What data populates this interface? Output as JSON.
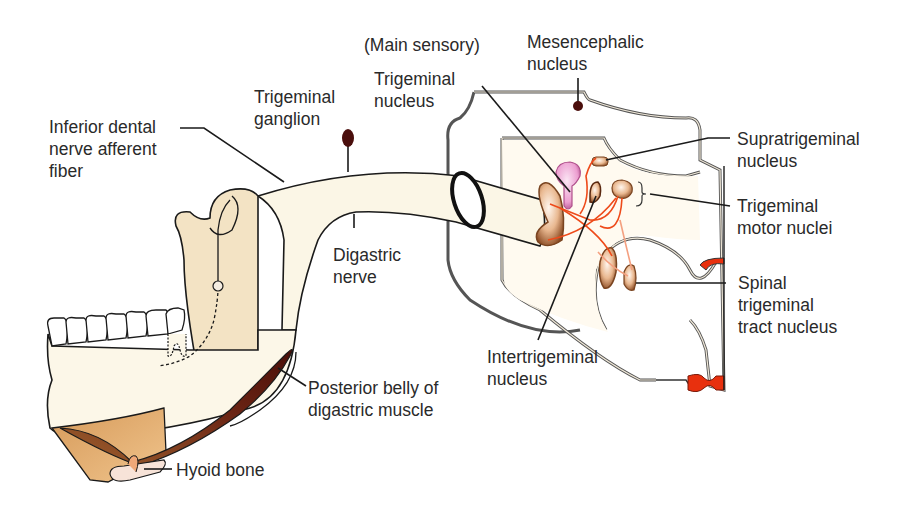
{
  "diagram": {
    "colors": {
      "nerve_fill": "#fbf6e6",
      "bone_fill": "#f3e3c4",
      "jaw_fill": "#fcf7e8",
      "muscle_dark": "#5a1a10",
      "hyoid_fill": "#f7e3d8",
      "nucleus_fill": "#e8b68c",
      "nucleus_edge": "#7a4420",
      "main_sensory_fill": "#ec9ed0",
      "fiber_red": "#ee4a1a",
      "red_marker": "#e8300e",
      "outline": "#1a1a1a",
      "ganglion": "#4a0e0c"
    },
    "labels": {
      "main_sensory_paren": "(Main sensory)",
      "trigeminal_nucleus": "Trigeminal\nnucleus",
      "mesencephalic_nucleus": "Mesencephalic\nnucleus",
      "trigeminal_ganglion": "Trigeminal\nganglion",
      "inferior_dental": "Inferior dental\nnerve afferent\nfiber",
      "supratrigeminal": "Supratrigeminal\nnucleus",
      "trigeminal_motor": "Trigeminal\nmotor nuclei",
      "digastric_nerve": "Digastric\nnerve",
      "spinal_trigeminal": "Spinal\ntrigeminal\ntract nucleus",
      "intertrigeminal": "Intertrigeminal\nnucleus",
      "posterior_belly": "Posterior belly of\ndigastric muscle",
      "hyoid_bone": "Hyoid bone"
    }
  }
}
